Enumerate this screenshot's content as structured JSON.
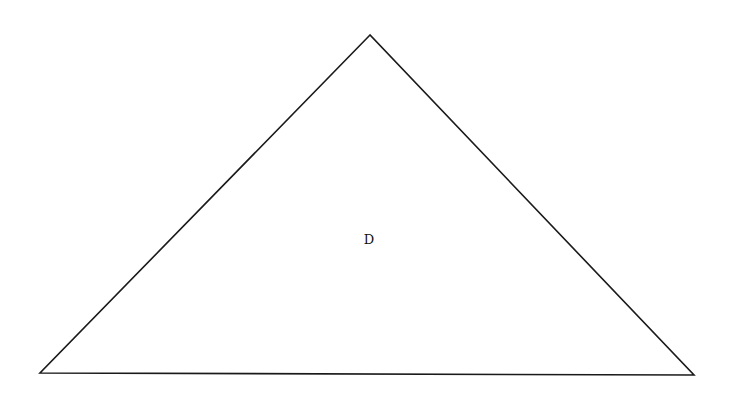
{
  "diagram": {
    "shape": "triangle",
    "stroke_color": "#1a1a1a",
    "background": "#ffffff",
    "vertices": {
      "apex": [
        370,
        35
      ],
      "bottom_left": [
        40,
        373
      ],
      "bottom_right": [
        694,
        375
      ]
    },
    "region_label": {
      "text": "D",
      "position": [
        369,
        240
      ]
    }
  }
}
